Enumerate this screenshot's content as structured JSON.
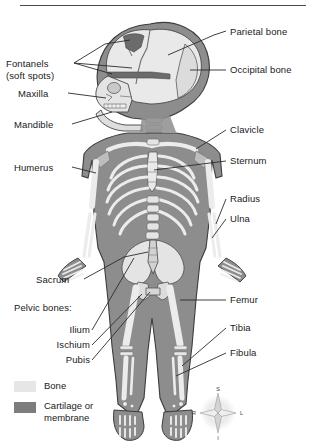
{
  "figure": {
    "view": "anterior full-body with lateral skull inset"
  },
  "labels_left": [
    {
      "name": "fontanels",
      "text": "Fontanels\n(soft spots)",
      "x": 6,
      "y": 58,
      "align": "left"
    },
    {
      "name": "maxilla",
      "text": "Maxilla",
      "x": 18,
      "y": 92,
      "align": "left"
    },
    {
      "name": "mandible",
      "text": "Mandible",
      "x": 14,
      "y": 123,
      "align": "left"
    },
    {
      "name": "humerus",
      "text": "Humerus",
      "x": 14,
      "y": 166,
      "align": "left"
    },
    {
      "name": "sacrum",
      "text": "Sacrum",
      "x": 36,
      "y": 278,
      "align": "left"
    },
    {
      "name": "pelvic-bones",
      "text": "Pelvic bones:",
      "x": 14,
      "y": 306,
      "align": "left"
    }
  ],
  "labels_pelvic": [
    {
      "name": "ilium",
      "text": "Ilium",
      "x": 24,
      "y": 327,
      "width": 66
    },
    {
      "name": "ischium",
      "text": "Ischium",
      "x": 24,
      "y": 342,
      "width": 66
    },
    {
      "name": "pubis",
      "text": "Pubis",
      "x": 24,
      "y": 357,
      "width": 66
    }
  ],
  "labels_right": [
    {
      "name": "parietal-bone",
      "text": "Parietal bone",
      "x": 228,
      "y": 30
    },
    {
      "name": "occipital-bone",
      "text": "Occipital bone",
      "x": 228,
      "y": 68
    },
    {
      "name": "clavicle",
      "text": "Clavicle",
      "x": 228,
      "y": 128
    },
    {
      "name": "sternum",
      "text": "Sternum",
      "x": 228,
      "y": 160
    },
    {
      "name": "radius",
      "text": "Radius",
      "x": 228,
      "y": 198
    },
    {
      "name": "ulna",
      "text": "Ulna",
      "x": 228,
      "y": 218
    },
    {
      "name": "femur",
      "text": "Femur",
      "x": 228,
      "y": 299
    },
    {
      "name": "tibia",
      "text": "Tibia",
      "x": 228,
      "y": 327
    },
    {
      "name": "fibula",
      "text": "Fibula",
      "x": 228,
      "y": 352
    }
  ],
  "legend": {
    "items": [
      {
        "name": "bone",
        "label": "Bone",
        "color": "#e6e6e6"
      },
      {
        "name": "cartilage",
        "label": "Cartilage or\nmembrane",
        "color": "#7d7d7d"
      }
    ]
  },
  "compass": {
    "superior": "S",
    "inferior": "I",
    "right": "R",
    "left": "L"
  },
  "colors": {
    "bone": "#e9e9e9",
    "cartilage": "#7d7d7d",
    "body": "#9a9a9a",
    "body_dark": "#6f6f6f",
    "outline": "#3c3c3c",
    "leader": "#2b2b2b",
    "text": "#1a1a1a"
  }
}
